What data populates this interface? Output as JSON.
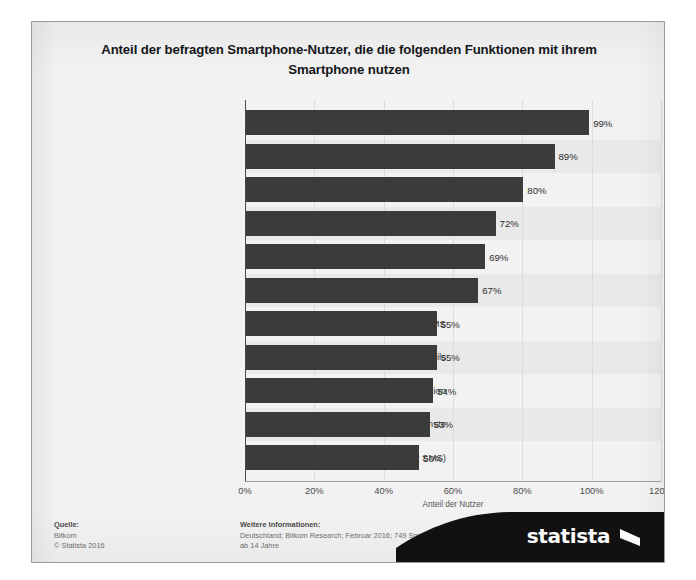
{
  "title": "Anteil der befragten Smartphone-Nutzer, die die folgenden Funktionen mit ihrem Smartphone nutzen",
  "colors": {
    "bar": "#3b3b3b",
    "background": "#f2f2f2",
    "band": "#e9e9e9",
    "axis": "#4a4a4a",
    "logo_banner": "#111111"
  },
  "footer": {
    "source_heading": "Quelle:",
    "source_name": "Bitkom",
    "copyright": "© Statista 2016",
    "info_heading": "Weitere Informationen:",
    "info_line1": "Deutschland; Bitkom Research; Februar 2016; 749 Smartphone-Nutzer;",
    "info_line2": "ab 14 Jahre",
    "logo_text": "statista"
  },
  "chart_data": {
    "type": "bar",
    "orientation": "horizontal",
    "title": "Anteil der befragten Smartphone-Nutzer, die die folgenden Funktionen mit ihrem Smartphone nutzen",
    "xlabel": "Anteil der Nutzer",
    "ylabel": "",
    "xlim": [
      0,
      120
    ],
    "xticks": [
      "0%",
      "20%",
      "40%",
      "60%",
      "80%",
      "100%",
      "120%"
    ],
    "xtick_values": [
      0,
      20,
      40,
      60,
      80,
      100,
      120
    ],
    "grid": "vertical-light",
    "legend": "none",
    "categories": [
      "Telefonieren",
      "Foto-/Videokamera",
      "Suchmaschine",
      "Kalender/Terminplaner",
      "Musik hören",
      "Soziale Netzwerke",
      "SMS",
      "E-Mails",
      "Weckfunktion",
      "Navigations/ Kartendienste",
      "Kurznachrichtendienste (außer SMS)"
    ],
    "values": [
      99,
      89,
      80,
      72,
      69,
      67,
      55,
      55,
      54,
      53,
      50
    ],
    "data_labels": [
      "99%",
      "89%",
      "80%",
      "72%",
      "69%",
      "67%",
      "55%",
      "55%",
      "54%",
      "53%",
      "50%"
    ]
  }
}
